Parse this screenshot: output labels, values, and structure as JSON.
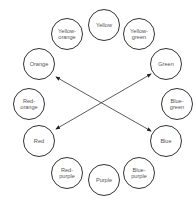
{
  "diagram": {
    "type": "color-wheel",
    "nodes": [
      {
        "id": "yellow",
        "label": "Yellow",
        "x": 104,
        "y": 25
      },
      {
        "id": "yellow-orange",
        "label": "Yellow-\norange",
        "x": 67,
        "y": 34
      },
      {
        "id": "yellow-green",
        "label": "Yellow-\ngreen",
        "x": 139,
        "y": 34
      },
      {
        "id": "orange",
        "label": "Orange",
        "x": 39,
        "y": 64
      },
      {
        "id": "green",
        "label": "Green",
        "x": 166,
        "y": 64
      },
      {
        "id": "red-orange",
        "label": "Red-\norange",
        "x": 29,
        "y": 104
      },
      {
        "id": "blue-green",
        "label": "Blue-\ngreen",
        "x": 177,
        "y": 104
      },
      {
        "id": "red",
        "label": "Red",
        "x": 39,
        "y": 141
      },
      {
        "id": "blue",
        "label": "Blue",
        "x": 166,
        "y": 141
      },
      {
        "id": "red-purple",
        "label": "Red-\npurple",
        "x": 67,
        "y": 173
      },
      {
        "id": "blue-purple",
        "label": "Blue-\npurple",
        "x": 139,
        "y": 173
      },
      {
        "id": "purple",
        "label": "Purple",
        "x": 104,
        "y": 180
      }
    ],
    "edges": [
      {
        "from": "orange",
        "to": "blue",
        "bidirectional": true
      },
      {
        "from": "red",
        "to": "green",
        "bidirectional": true
      }
    ]
  }
}
